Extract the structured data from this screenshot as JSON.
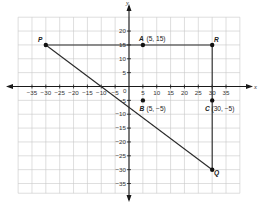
{
  "diagram": {
    "type": "coordinate-plane",
    "axes": {
      "x_label": "x",
      "y_label": "y",
      "origin_label": "0",
      "x_ticks": [
        -35,
        -30,
        -25,
        -20,
        -15,
        -10,
        -5,
        5,
        10,
        15,
        20,
        25,
        30,
        35
      ],
      "y_ticks": [
        20,
        15,
        10,
        5,
        -5,
        -10,
        -15,
        -20,
        -25,
        -30,
        -35
      ],
      "x_tick_labels": [
        "−35",
        "−30",
        "−25",
        "−20",
        "−15",
        "−10",
        "−5",
        "5",
        "10",
        "15",
        "20",
        "25",
        "30",
        "35"
      ],
      "y_tick_labels": [
        "20",
        "15",
        "10",
        "5",
        "−5",
        "−10",
        "−15",
        "−20",
        "−25",
        "−30",
        "−35"
      ]
    },
    "points": {
      "P": {
        "name": "P",
        "coords_label": "",
        "x": -30,
        "y": 15
      },
      "A": {
        "name": "A",
        "coords_label": "(5, 15)",
        "x": 5,
        "y": 15
      },
      "R": {
        "name": "R",
        "coords_label": "",
        "x": 30,
        "y": 15
      },
      "B": {
        "name": "B",
        "coords_label": "(5, −5)",
        "x": 5,
        "y": -5
      },
      "C": {
        "name": "C",
        "coords_label": "(30, −5)",
        "x": 30,
        "y": -5
      },
      "Q": {
        "name": "Q",
        "coords_label": "",
        "x": 30,
        "y": -30
      }
    },
    "segments": [
      {
        "from": "P",
        "to": "R"
      },
      {
        "from": "R",
        "to": "Q"
      },
      {
        "from": "P",
        "to": "Q"
      }
    ],
    "colors": {
      "grid": "#c8c8c8",
      "axis": "#1a1a1a",
      "segment": "#2a2a2a",
      "point": "#111111"
    }
  }
}
